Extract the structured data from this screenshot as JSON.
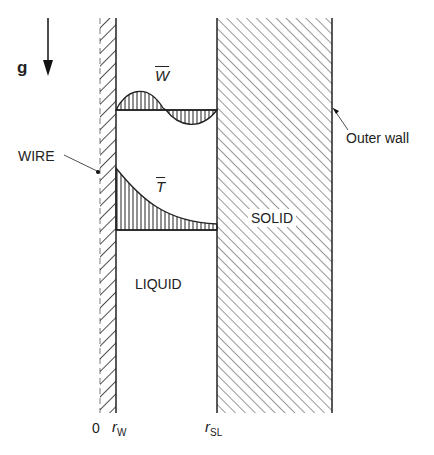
{
  "diagram": {
    "labels": {
      "gravity": "g",
      "velocity_profile": "W",
      "temperature_profile": "T",
      "wire": "WIRE",
      "outer_wall": "Outer wall",
      "solid": "SOLID",
      "liquid": "LIQUID",
      "axis_origin": "0",
      "r_wire_symbol": "r",
      "r_wire_sub": "W",
      "r_sl_symbol": "r",
      "r_sl_sub": "SL"
    },
    "regions": [
      {
        "name": "wire",
        "hatch": "back-diagonal"
      },
      {
        "name": "liquid",
        "hatch": "none"
      },
      {
        "name": "solid",
        "hatch": "forward-diagonal"
      }
    ],
    "profiles": [
      {
        "name": "W",
        "description": "velocity profile: positive near wire, negative near solid interface"
      },
      {
        "name": "T",
        "description": "temperature profile: decays from wire to solid-liquid interface"
      }
    ],
    "colors": {
      "line": "#222222",
      "background": "#ffffff"
    }
  }
}
